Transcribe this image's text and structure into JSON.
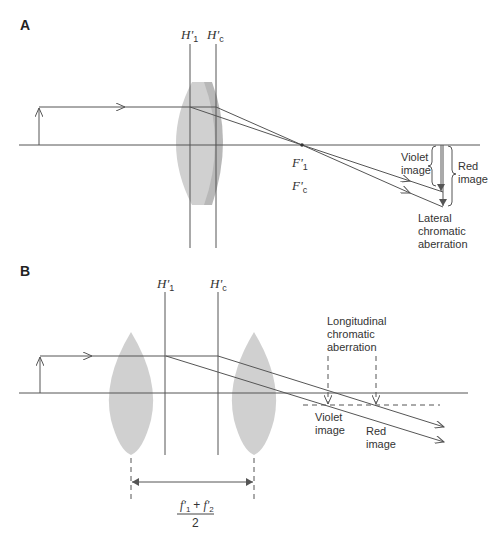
{
  "colors": {
    "line": "#555555",
    "lens_light": "#cfcfcf",
    "lens_dark": "#b5b5b5",
    "text": "#333333",
    "background": "#ffffff"
  },
  "panel_a": {
    "label": "A",
    "principal_planes": [
      {
        "name": "H'",
        "sub": "1"
      },
      {
        "name": "H'",
        "sub": "c"
      }
    ],
    "focal_points": [
      {
        "name": "F'",
        "sub": "1"
      },
      {
        "name": "F'",
        "sub": "c"
      }
    ],
    "violet_image": [
      "Violet",
      "image"
    ],
    "red_image": [
      "Red",
      "image"
    ],
    "aberration": [
      "Lateral",
      "chromatic",
      "aberration"
    ]
  },
  "panel_b": {
    "label": "B",
    "principal_planes": [
      {
        "name": "H'",
        "sub": "1"
      },
      {
        "name": "H'",
        "sub": "c"
      }
    ],
    "aberration": [
      "Longitudinal",
      "chromatic",
      "aberration"
    ],
    "violet_image": [
      "Violet",
      "image"
    ],
    "red_image": [
      "Red",
      "image"
    ],
    "separation_formula": {
      "numerator": "f'1 + f'2",
      "num_a": "f'",
      "num_a_sub": "1",
      "plus": "+",
      "num_b": "f'",
      "num_b_sub": "2",
      "denominator": "2"
    }
  }
}
